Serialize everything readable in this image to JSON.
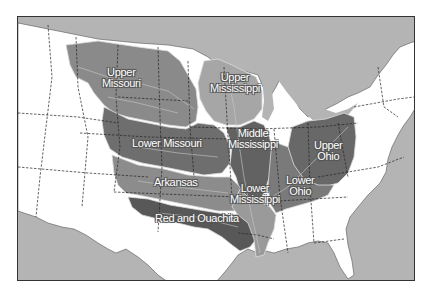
{
  "map": {
    "title": "Mississippi River Basin sub-basins",
    "colors": {
      "water": "#b4b4b4",
      "land": "#ffffff",
      "state_border": "#333333",
      "basin_border": "#e6e6e6",
      "upper_missouri": "#8a8a8a",
      "lower_missouri": "#6e6e6e",
      "upper_mississippi": "#a6a6a6",
      "middle_mississippi": "#626262",
      "arkansas": "#8c8c8c",
      "red_and_ouachita": "#585858",
      "lower_mississippi": "#9a9a9a",
      "upper_ohio": "#686868",
      "lower_ohio": "#7a7a7a"
    },
    "regions": [
      {
        "id": "upper_missouri",
        "label_line1": "Upper",
        "label_line2": "Missouri"
      },
      {
        "id": "upper_mississippi",
        "label_line1": "Upper",
        "label_line2": "Mississippi"
      },
      {
        "id": "lower_missouri",
        "label_line1": "Lower Missouri",
        "label_line2": ""
      },
      {
        "id": "middle_mississippi",
        "label_line1": "Middle",
        "label_line2": "Mississippi"
      },
      {
        "id": "upper_ohio",
        "label_line1": "Upper",
        "label_line2": "Ohio"
      },
      {
        "id": "arkansas",
        "label_line1": "Arkansas",
        "label_line2": ""
      },
      {
        "id": "lower_mississippi",
        "label_line1": "Lower",
        "label_line2": "Mississippi"
      },
      {
        "id": "lower_ohio",
        "label_line1": "Lower",
        "label_line2": "Ohio"
      },
      {
        "id": "red_and_ouachita",
        "label_line1": "Red and Ouachita",
        "label_line2": ""
      }
    ]
  }
}
